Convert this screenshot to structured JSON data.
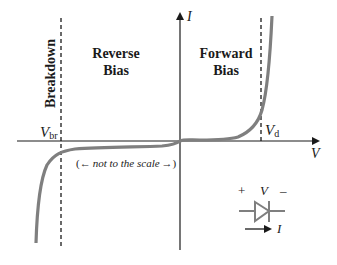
{
  "diagram": {
    "axes": {
      "x_label": "V",
      "y_label": "I"
    },
    "regions": {
      "breakdown": "Breakdown",
      "reverse_bias_line1": "Reverse",
      "reverse_bias_line2": "Bias",
      "forward_bias_line1": "Forward",
      "forward_bias_line2": "Bias"
    },
    "markers": {
      "v_breakdown_main": "V",
      "v_breakdown_sub": "br",
      "v_diode_main": "V",
      "v_diode_sub": "d"
    },
    "annotation": {
      "left_arrow": "←",
      "text": "not to the scale",
      "right_arrow": "→",
      "open_paren": "(",
      "close_paren": ")"
    },
    "diode_symbol": {
      "plus": "+",
      "voltage": "V",
      "minus": "–",
      "current": "I"
    },
    "colors": {
      "axis": "#1a1a1a",
      "curve": "#7f7f7f",
      "dashed": "#1a1a1a",
      "symbol": "#7f7f7f"
    }
  }
}
